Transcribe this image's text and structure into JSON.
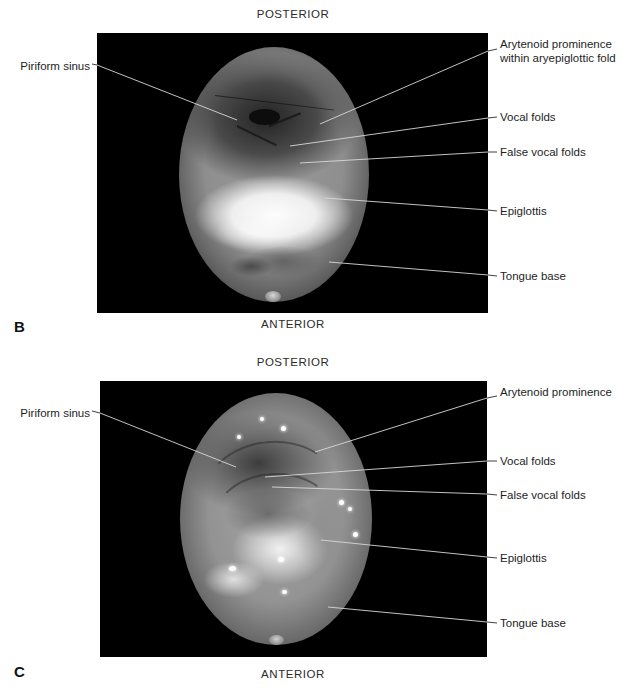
{
  "figure": {
    "panels": [
      {
        "letter": "B",
        "orientation_top": "POSTERIOR",
        "orientation_bottom": "ANTERIOR",
        "image_kind": "endoscopic-photograph",
        "labels_left": [
          {
            "name": "piriform-sinus",
            "text": "Piriform sinus"
          }
        ],
        "labels_right": [
          {
            "name": "arytenoid-prominence",
            "text": "Arytenoid prominence\nwithin aryepiglottic fold"
          },
          {
            "name": "vocal-folds",
            "text": "Vocal folds"
          },
          {
            "name": "false-vocal-folds",
            "text": "False vocal folds"
          },
          {
            "name": "epiglottis",
            "text": "Epiglottis"
          },
          {
            "name": "tongue-base",
            "text": "Tongue base"
          }
        ]
      },
      {
        "letter": "C",
        "orientation_top": "POSTERIOR",
        "orientation_bottom": "ANTERIOR",
        "image_kind": "endoscopic-photograph",
        "labels_left": [
          {
            "name": "piriform-sinus",
            "text": "Piriform sinus"
          }
        ],
        "labels_right": [
          {
            "name": "arytenoid-prominence",
            "text": "Arytenoid prominence"
          },
          {
            "name": "vocal-folds",
            "text": "Vocal folds"
          },
          {
            "name": "false-vocal-folds",
            "text": "False vocal folds"
          },
          {
            "name": "epiglottis",
            "text": "Epiglottis"
          },
          {
            "name": "tongue-base",
            "text": "Tongue base"
          }
        ]
      }
    ],
    "colors": {
      "page_background": "#ffffff",
      "photo_background": "#000000",
      "text": "#1e1e1e",
      "leader_line": "#2a2a2a"
    }
  }
}
